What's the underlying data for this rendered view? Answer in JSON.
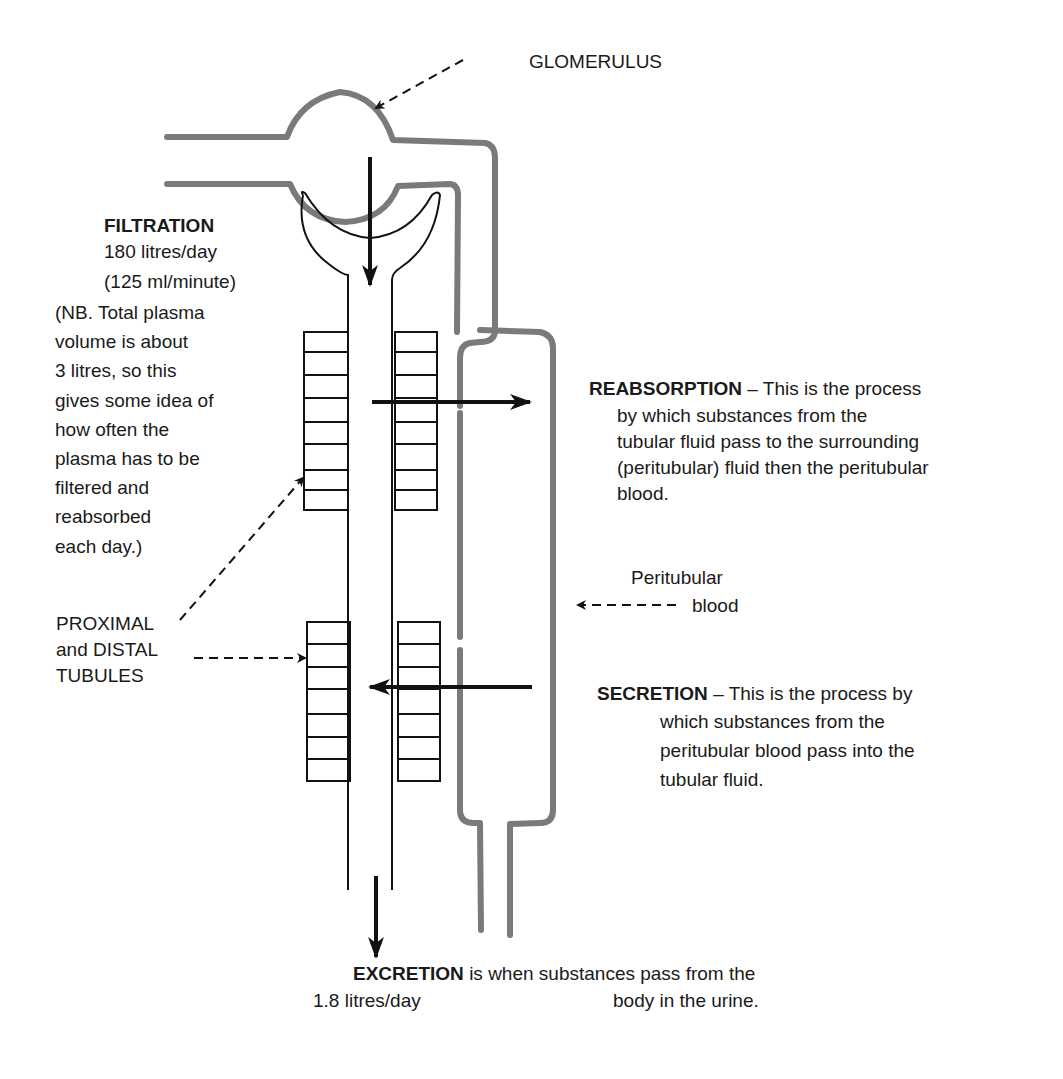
{
  "labels": {
    "glomerulus": "GLOMERULUS",
    "filtration": {
      "title": "FILTRATION",
      "rate_day": "180 litres/day",
      "rate_minute": "(125 ml/minute)",
      "note_lines": [
        "(NB. Total plasma",
        "volume is about",
        "3 litres, so this",
        "gives some idea of",
        "how often the",
        "plasma has to be",
        "filtered and",
        "reabsorbed",
        "each day.)"
      ]
    },
    "tubules": {
      "lines": [
        "PROXIMAL",
        "and DISTAL",
        "TUBULES"
      ]
    },
    "reabsorption": {
      "title": "REABSORPTION",
      "lead": " – This is the process",
      "lines": [
        "by which substances from the",
        "tubular fluid pass to the surrounding",
        "(peritubular) fluid then the peritubular",
        "blood."
      ]
    },
    "peritubular_blood": {
      "lines": [
        "Peritubular",
        "blood"
      ]
    },
    "secretion": {
      "title": "SECRETION",
      "lead": " – This is the process by",
      "lines": [
        "which substances from the",
        "peritubular blood pass into the",
        "tubular fluid."
      ]
    },
    "excretion": {
      "title": "EXCRETION",
      "lead": " is when substances pass from the",
      "line2": "body in the urine.",
      "rate": "1.8 litres/day"
    }
  },
  "colors": {
    "vessel": "#7a7a7a",
    "ink": "#111111",
    "background": "#ffffff"
  }
}
